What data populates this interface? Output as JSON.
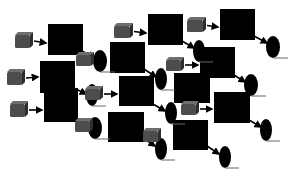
{
  "canvas": {
    "width": 293,
    "height": 175,
    "background": "#ffffff"
  },
  "colors": {
    "square": "#000000",
    "ellipse": "#000000",
    "cube_face": "#4d4d4d",
    "cube_top": "#6e6e6e",
    "cube_side": "#2e2e2e",
    "arrow": "#000000",
    "baseline": "#666666"
  },
  "squares": [
    {
      "x": 48,
      "y": 24,
      "w": 35,
      "h": 31
    },
    {
      "x": 40,
      "y": 61,
      "w": 35,
      "h": 32
    },
    {
      "x": 44,
      "y": 88,
      "w": 34,
      "h": 34
    },
    {
      "x": 110,
      "y": 42,
      "w": 35,
      "h": 31
    },
    {
      "x": 119,
      "y": 76,
      "w": 35,
      "h": 30
    },
    {
      "x": 108,
      "y": 112,
      "w": 36,
      "h": 30
    },
    {
      "x": 148,
      "y": 14,
      "w": 35,
      "h": 31
    },
    {
      "x": 200,
      "y": 47,
      "w": 35,
      "h": 31
    },
    {
      "x": 174,
      "y": 73,
      "w": 36,
      "h": 30
    },
    {
      "x": 214,
      "y": 92,
      "w": 36,
      "h": 31
    },
    {
      "x": 173,
      "y": 120,
      "w": 35,
      "h": 30
    },
    {
      "x": 220,
      "y": 9,
      "w": 35,
      "h": 31
    }
  ],
  "cubes": [
    {
      "x": 15,
      "y": 32,
      "w": 18,
      "h": 16,
      "arrow_to": [
        46,
        43
      ]
    },
    {
      "x": 7,
      "y": 69,
      "w": 18,
      "h": 16,
      "arrow_to": [
        38,
        77
      ]
    },
    {
      "x": 10,
      "y": 101,
      "w": 18,
      "h": 16,
      "arrow_to": [
        42,
        110
      ]
    },
    {
      "x": 76,
      "y": 52,
      "w": 18,
      "h": 14,
      "arrow_to": null
    },
    {
      "x": 85,
      "y": 86,
      "w": 18,
      "h": 14,
      "arrow_to": [
        117,
        94
      ]
    },
    {
      "x": 75,
      "y": 118,
      "w": 18,
      "h": 14,
      "arrow_to": null
    },
    {
      "x": 114,
      "y": 23,
      "w": 19,
      "h": 15,
      "arrow_to": [
        146,
        33
      ]
    },
    {
      "x": 187,
      "y": 17,
      "w": 19,
      "h": 15,
      "arrow_to": [
        218,
        27
      ]
    },
    {
      "x": 166,
      "y": 57,
      "w": 18,
      "h": 14,
      "arrow_to": [
        198,
        65
      ]
    },
    {
      "x": 181,
      "y": 101,
      "w": 18,
      "h": 14,
      "arrow_to": [
        212,
        109
      ]
    },
    {
      "x": 143,
      "y": 128,
      "w": 18,
      "h": 14,
      "arrow_to": null
    }
  ],
  "ellipses": [
    {
      "cx": 100,
      "cy": 61,
      "rx": 7,
      "ry": 11
    },
    {
      "cx": 92,
      "cy": 95,
      "rx": 6,
      "ry": 11
    },
    {
      "cx": 95,
      "cy": 128,
      "rx": 7,
      "ry": 11
    },
    {
      "cx": 161,
      "cy": 79,
      "rx": 6,
      "ry": 11
    },
    {
      "cx": 171,
      "cy": 113,
      "rx": 6,
      "ry": 11
    },
    {
      "cx": 161,
      "cy": 149,
      "rx": 6,
      "ry": 11
    },
    {
      "cx": 199,
      "cy": 51,
      "rx": 6,
      "ry": 11
    },
    {
      "cx": 251,
      "cy": 85,
      "rx": 7,
      "ry": 11
    },
    {
      "cx": 266,
      "cy": 130,
      "rx": 6,
      "ry": 11
    },
    {
      "cx": 225,
      "cy": 157,
      "rx": 6,
      "ry": 11
    },
    {
      "cx": 273,
      "cy": 47,
      "rx": 7,
      "ry": 11
    }
  ],
  "connectors": [
    {
      "from": [
        82,
        51
      ],
      "to": [
        94,
        58
      ]
    },
    {
      "from": [
        74,
        88
      ],
      "to": [
        86,
        94
      ]
    },
    {
      "from": [
        77,
        119
      ],
      "to": [
        89,
        126
      ]
    },
    {
      "from": [
        144,
        69
      ],
      "to": [
        156,
        77
      ]
    },
    {
      "from": [
        153,
        104
      ],
      "to": [
        165,
        111
      ]
    },
    {
      "from": [
        143,
        138
      ],
      "to": [
        155,
        146
      ]
    },
    {
      "from": [
        182,
        41
      ],
      "to": [
        194,
        48
      ]
    },
    {
      "from": [
        234,
        75
      ],
      "to": [
        245,
        82
      ]
    },
    {
      "from": [
        249,
        120
      ],
      "to": [
        261,
        127
      ]
    },
    {
      "from": [
        207,
        146
      ],
      "to": [
        219,
        154
      ]
    },
    {
      "from": [
        254,
        36
      ],
      "to": [
        267,
        43
      ]
    }
  ]
}
